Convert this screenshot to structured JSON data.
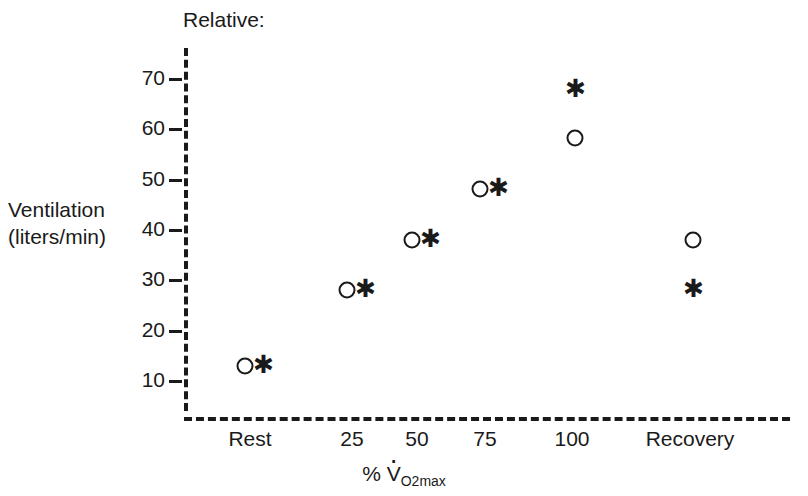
{
  "chart_data": {
    "type": "scatter",
    "title": "Relative:",
    "xlabel": "% V̇O2max",
    "xlabel_parts": {
      "percent": "%",
      "v": "V",
      "sub": "O",
      "sub2": "2",
      "submax": "max"
    },
    "ylabel": "Ventilation (liters/min)",
    "ylabel_line1": "Ventilation",
    "ylabel_line2": "(liters/min)",
    "categories": [
      "Rest",
      "25",
      "50",
      "75",
      "100",
      "Recovery"
    ],
    "ylim": [
      5,
      75
    ],
    "yticks": [
      10,
      20,
      30,
      40,
      50,
      60,
      70
    ],
    "ytick_labels": [
      "10",
      "20",
      "30",
      "40",
      "50",
      "60",
      "70"
    ],
    "grid": false,
    "legend": "none",
    "series": [
      {
        "name": "circle",
        "marker": "open-circle",
        "values": [
          12.8,
          27.9,
          37.8,
          47.9,
          58.0,
          37.8
        ]
      },
      {
        "name": "asterisk",
        "marker": "asterisk",
        "values": [
          13.3,
          28.5,
          38.5,
          48.6,
          68.3,
          28.5
        ]
      }
    ],
    "colors": {
      "ink": "#1a1a1a",
      "background": "#ffffff"
    }
  }
}
